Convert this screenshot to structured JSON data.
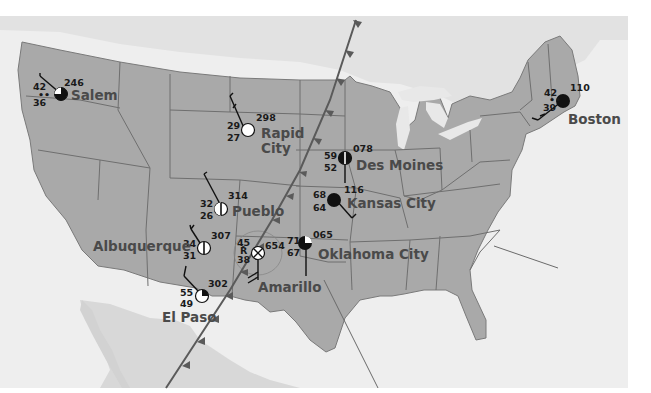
{
  "map": {
    "title": "",
    "colors": {
      "land_us": "#a9a9a9",
      "land_other": "#d9d9d9",
      "water": "#eeeeee",
      "background": "#ffffff",
      "state_border": "#6f6f6f",
      "front": "#5a5a5a",
      "label": "#4a4a4a"
    },
    "cold_front": {
      "type": "cold-front",
      "direction": "southeast"
    },
    "stations": [
      {
        "city": "Salem",
        "temperature": "42",
        "dew_point": "36",
        "pressure": "246",
        "sky_cover": "three-quarters",
        "weather": "drizzle"
      },
      {
        "city": "Rapid City",
        "city_line1": "Rapid",
        "city_line2": "City",
        "temperature": "29",
        "dew_point": "27",
        "pressure": "298",
        "sky_cover": "clear",
        "weather": ""
      },
      {
        "city": "Des Moines",
        "temperature": "59",
        "dew_point": "52",
        "pressure": "078",
        "sky_cover": "half",
        "weather": ""
      },
      {
        "city": "Kansas City",
        "temperature": "68",
        "dew_point": "64",
        "pressure": "116",
        "sky_cover": "overcast",
        "weather": ""
      },
      {
        "city": "Boston",
        "temperature": "42",
        "dew_point": "39",
        "pressure": "110",
        "sky_cover": "overcast",
        "weather": "drizzle"
      },
      {
        "city": "Pueblo",
        "temperature": "32",
        "dew_point": "26",
        "pressure": "314",
        "sky_cover": "half",
        "weather": ""
      },
      {
        "city": "Albuquerque",
        "temperature": "34",
        "dew_point": "31",
        "pressure": "307",
        "sky_cover": "half",
        "weather": ""
      },
      {
        "city": "Amarillo",
        "temperature": "45",
        "dew_point": "38",
        "pressure": "654",
        "sky_cover": "obscured",
        "weather": "thunderstorm"
      },
      {
        "city": "Oklahoma City",
        "temperature": "71",
        "dew_point": "67",
        "pressure": "065",
        "sky_cover": "three-quarters",
        "weather": ""
      },
      {
        "city": "El Paso",
        "temperature": "55",
        "dew_point": "49",
        "pressure": "302",
        "sky_cover": "quarter",
        "weather": ""
      }
    ]
  }
}
